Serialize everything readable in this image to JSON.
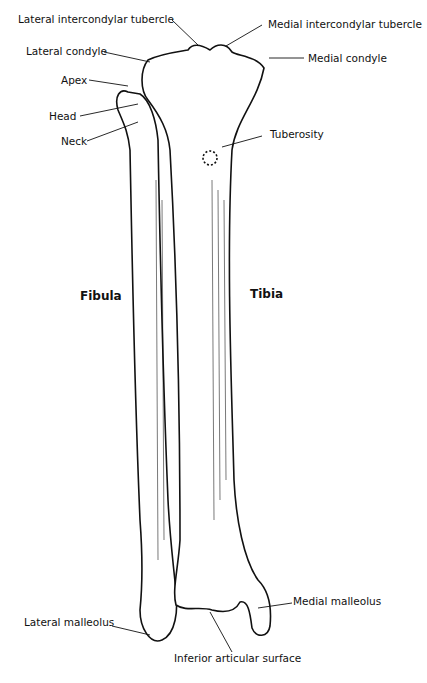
{
  "diagram": {
    "bones": [
      {
        "id": "fibula",
        "label": "Fibula"
      },
      {
        "id": "tibia",
        "label": "Tibia"
      }
    ],
    "labels": {
      "lateral_intercondylar_tubercle": "Lateral intercondylar tubercle",
      "medial_intercondylar_tubercle": "Medial intercondylar tubercle",
      "lateral_condyle": "Lateral condyle",
      "medial_condyle": "Medial condyle",
      "apex": "Apex",
      "head": "Head",
      "neck": "Neck",
      "tuberosity": "Tuberosity",
      "fibula": "Fibula",
      "tibia": "Tibia",
      "lateral_malleolus": "Lateral malleolus",
      "medial_malleolus": "Medial malleolus",
      "inferior_articular_surface": "Inferior articular surface"
    },
    "colors": {
      "ink": "#111111",
      "background": "#ffffff"
    }
  }
}
